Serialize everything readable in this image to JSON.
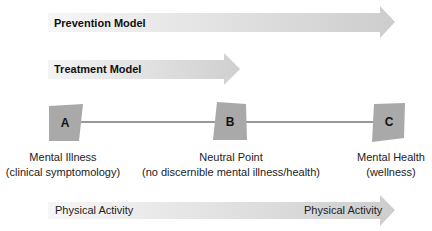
{
  "models": {
    "prevention": {
      "label": "Prevention Model"
    },
    "treatment": {
      "label": "Treatment Model"
    }
  },
  "continuum": {
    "points": [
      {
        "letter": "A",
        "title": "Mental Illness",
        "subtitle": "(clinical symptomology)"
      },
      {
        "letter": "B",
        "title": "Neutral Point",
        "subtitle": "(no discernible mental illness/health)"
      },
      {
        "letter": "C",
        "title": "Mental Health",
        "subtitle": "(wellness)"
      }
    ]
  },
  "physical_activity": {
    "start_label": "Physical Activity",
    "end_label": "Physical Activity"
  },
  "colors": {
    "arrow_light": "#f4f4f4",
    "arrow_dark": "#cfcfcf",
    "box_fill": "#a9a9a9",
    "line": "#333333"
  }
}
